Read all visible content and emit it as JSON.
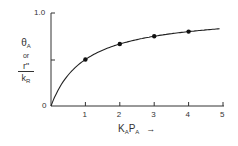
{
  "chart_data": {
    "type": "line",
    "title": "",
    "xlabel": "KAPA",
    "xlabel_parts": {
      "k": "K",
      "k_sub": "A",
      "p": "P",
      "p_sub": "A",
      "arrow": "→"
    },
    "ylabel": "θA or r''/kR",
    "ylabel_parts": {
      "theta": "θ",
      "theta_sub": "A",
      "or": "or",
      "num": "r\"",
      "den": "k",
      "den_sub": "R"
    },
    "x_ticks": [
      "1",
      "2",
      "3",
      "4",
      "5"
    ],
    "y_ticks": [
      "0",
      "1.0"
    ],
    "xlim": [
      0,
      5
    ],
    "ylim": [
      0,
      1.0
    ],
    "grid": false,
    "series": [
      {
        "name": "Langmuir isotherm",
        "x": [
          0,
          1,
          2,
          3,
          4,
          5
        ],
        "values": [
          0,
          0.5,
          0.667,
          0.75,
          0.8,
          0.833
        ],
        "markers_at": [
          1,
          2,
          3,
          4
        ]
      }
    ]
  }
}
